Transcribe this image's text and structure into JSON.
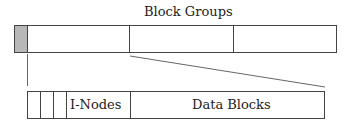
{
  "title": "Block Groups",
  "top_bar": {
    "segments": [
      "superblock",
      "group-1",
      "group-2",
      "group-3"
    ],
    "superblock_color": "#b8b8b8"
  },
  "bottom_bar": {
    "small_cells": 3,
    "inodes_label": "I-Nodes",
    "data_label": "Data Blocks"
  },
  "colors": {
    "stroke": "#444444",
    "background": "#ffffff"
  }
}
